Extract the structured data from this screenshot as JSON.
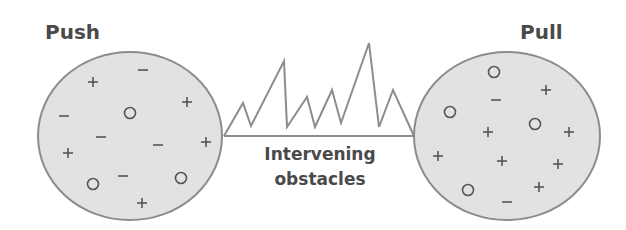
{
  "diagram": {
    "left": {
      "title": "Push",
      "center": [
        130,
        136
      ],
      "radius": [
        92,
        84
      ],
      "symbols": [
        {
          "type": "minus",
          "x": 143,
          "y": 70
        },
        {
          "type": "plus",
          "x": 93,
          "y": 82
        },
        {
          "type": "plus",
          "x": 187,
          "y": 102
        },
        {
          "type": "minus",
          "x": 64,
          "y": 116
        },
        {
          "type": "circle",
          "x": 130,
          "y": 113
        },
        {
          "type": "minus",
          "x": 101,
          "y": 137
        },
        {
          "type": "minus",
          "x": 158,
          "y": 145
        },
        {
          "type": "plus",
          "x": 206,
          "y": 142
        },
        {
          "type": "plus",
          "x": 68,
          "y": 153
        },
        {
          "type": "minus",
          "x": 123,
          "y": 176
        },
        {
          "type": "circle",
          "x": 93,
          "y": 184
        },
        {
          "type": "circle",
          "x": 181,
          "y": 178
        },
        {
          "type": "plus",
          "x": 142,
          "y": 203
        }
      ]
    },
    "right": {
      "title": "Pull",
      "center": [
        507,
        136
      ],
      "radius": [
        93,
        84
      ],
      "symbols": [
        {
          "type": "circle",
          "x": 494,
          "y": 72
        },
        {
          "type": "plus",
          "x": 546,
          "y": 90
        },
        {
          "type": "minus",
          "x": 496,
          "y": 100
        },
        {
          "type": "circle",
          "x": 450,
          "y": 112
        },
        {
          "type": "circle",
          "x": 535,
          "y": 124
        },
        {
          "type": "plus",
          "x": 488,
          "y": 132
        },
        {
          "type": "plus",
          "x": 569,
          "y": 132
        },
        {
          "type": "plus",
          "x": 438,
          "y": 156
        },
        {
          "type": "plus",
          "x": 502,
          "y": 161
        },
        {
          "type": "plus",
          "x": 558,
          "y": 164
        },
        {
          "type": "plus",
          "x": 539,
          "y": 187
        },
        {
          "type": "circle",
          "x": 468,
          "y": 190
        },
        {
          "type": "minus",
          "x": 507,
          "y": 202
        }
      ]
    },
    "obstacles": {
      "label_line1": "Intervening",
      "label_line2": "obstacles",
      "baseline": [
        [
          224,
          136
        ],
        [
          414,
          136
        ]
      ],
      "zigzag": [
        [
          224,
          136
        ],
        [
          243,
          103
        ],
        [
          251,
          126
        ],
        [
          284,
          61
        ],
        [
          287,
          127
        ],
        [
          307,
          97
        ],
        [
          315,
          127
        ],
        [
          332,
          90
        ],
        [
          341,
          123
        ],
        [
          369,
          43
        ],
        [
          379,
          127
        ],
        [
          393,
          90
        ],
        [
          414,
          136
        ]
      ]
    },
    "colors": {
      "fill": "#e2e2e2",
      "stroke": "#8c8c8c",
      "symbol": "#555555",
      "text": "#4a4a4a"
    }
  }
}
